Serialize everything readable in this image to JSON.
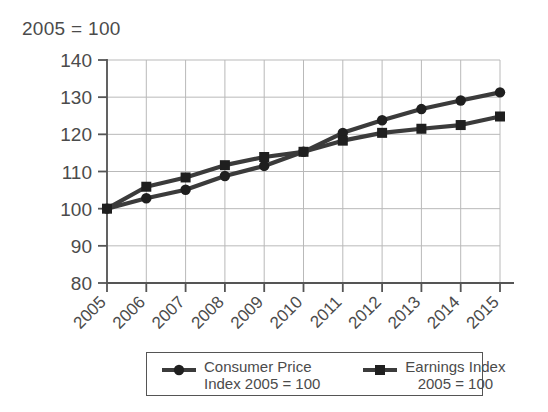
{
  "chart": {
    "title": "2005 = 100",
    "axis_color": "#555555",
    "grid_color": "#b9b9b9",
    "series_color": "#3b3b3b"
  },
  "legend": {
    "entries": [
      {
        "name": "consumer-price-index",
        "marker": "circle-marker",
        "line1": "Consumer Price",
        "line2": "Index 2005 = 100"
      },
      {
        "name": "earnings-index",
        "marker": "square-marker",
        "line1": "Earnings Index",
        "line2": "2005 = 100"
      }
    ]
  },
  "chart_data": {
    "type": "line",
    "title": "2005 = 100",
    "xlabel": "",
    "ylabel": "",
    "categories": [
      "2005",
      "2006",
      "2007",
      "2008",
      "2009",
      "2010",
      "2011",
      "2012",
      "2013",
      "2014",
      "2015"
    ],
    "x": [
      2005,
      2006,
      2007,
      2008,
      2009,
      2010,
      2011,
      2012,
      2013,
      2014,
      2015
    ],
    "ylim": [
      80,
      140
    ],
    "yticks": [
      80,
      90,
      100,
      110,
      120,
      130,
      140
    ],
    "grid": true,
    "legend_position": "bottom",
    "series": [
      {
        "name": "Consumer Price Index 2005 = 100",
        "marker": "circle",
        "values": [
          100,
          102.8,
          105.1,
          108.8,
          111.5,
          115.3,
          120.4,
          123.8,
          126.8,
          129.1,
          131.3
        ]
      },
      {
        "name": "Earnings Index 2005 = 100",
        "marker": "square",
        "values": [
          100,
          105.9,
          108.4,
          111.7,
          113.9,
          115.3,
          118.3,
          120.4,
          121.5,
          122.5,
          124.8
        ]
      }
    ]
  }
}
